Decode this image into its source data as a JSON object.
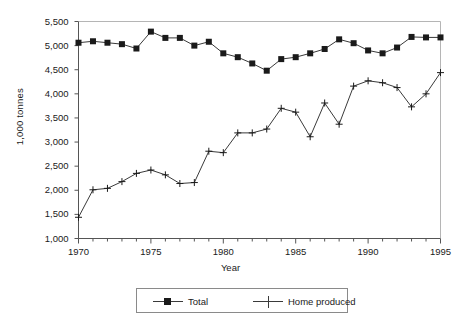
{
  "chart_data": {
    "type": "line",
    "title": "",
    "xlabel": "Year",
    "ylabel": "1,000 tonnes",
    "xlim": [
      1970,
      1995
    ],
    "ylim": [
      1000,
      5500
    ],
    "grid": false,
    "legend_position": "bottom",
    "x": [
      1970,
      1971,
      1972,
      1973,
      1974,
      1975,
      1976,
      1977,
      1978,
      1979,
      1980,
      1981,
      1982,
      1983,
      1984,
      1985,
      1986,
      1987,
      1988,
      1989,
      1990,
      1991,
      1992,
      1993,
      1994,
      1995
    ],
    "xtick_labels": [
      "1970",
      "1975",
      "1980",
      "1985",
      "1990",
      "1995"
    ],
    "xtick_values": [
      1970,
      1975,
      1980,
      1985,
      1990,
      1995
    ],
    "ytick_labels": [
      "1,000",
      "1,500",
      "2,000",
      "2,500",
      "3,000",
      "3,500",
      "4,000",
      "4,500",
      "5,000",
      "5,500"
    ],
    "ytick_values": [
      1000,
      1500,
      2000,
      2500,
      3000,
      3500,
      4000,
      4500,
      5000,
      5500
    ],
    "series": [
      {
        "name": "Total",
        "marker": "square",
        "values": [
          5060,
          5090,
          5060,
          5030,
          4940,
          5290,
          5160,
          5160,
          5000,
          5080,
          4840,
          4760,
          4630,
          4480,
          4720,
          4760,
          4840,
          4930,
          5130,
          5050,
          4900,
          4840,
          4960,
          5180,
          5170,
          5170
        ]
      },
      {
        "name": "Home produced",
        "marker": "plus",
        "values": [
          1440,
          2010,
          2040,
          2180,
          2350,
          2420,
          2320,
          2140,
          2160,
          2810,
          2780,
          3190,
          3190,
          3270,
          3700,
          3620,
          3110,
          3810,
          3370,
          4160,
          4270,
          4230,
          4130,
          3730,
          4000,
          4440
        ]
      }
    ]
  },
  "legend": {
    "entries": [
      {
        "label": "Total"
      },
      {
        "label": "Home produced"
      }
    ]
  },
  "colors": {
    "line": "#3a3a3a",
    "marker": "#1a1a1a",
    "axis": "#8a8a8a",
    "text": "#1a1a1a"
  }
}
